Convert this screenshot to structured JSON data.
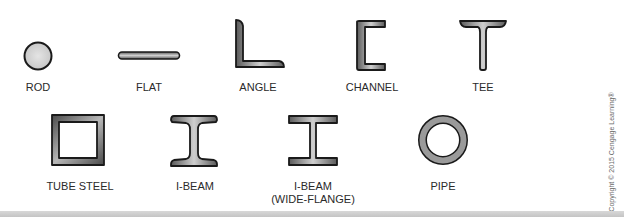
{
  "diagram": {
    "shapes": [
      {
        "id": "rod",
        "label": "ROD"
      },
      {
        "id": "flat",
        "label": "FLAT"
      },
      {
        "id": "angle",
        "label": "ANGLE"
      },
      {
        "id": "channel",
        "label": "CHANNEL"
      },
      {
        "id": "tee",
        "label": "TEE"
      },
      {
        "id": "tube-steel",
        "label": "TUBE STEEL"
      },
      {
        "id": "i-beam",
        "label": "I-BEAM"
      },
      {
        "id": "i-beam-wide-flange",
        "label_line1": "I-BEAM",
        "label_line2": "(WIDE-FLANGE)"
      },
      {
        "id": "pipe",
        "label": "PIPE"
      }
    ],
    "copyright": "Copyright © 2015 Cengage Learning®"
  },
  "colors": {
    "outline": "#1a1a1a",
    "fill_light": "#d9d9d9",
    "fill_dark": "#6e6e6e",
    "label": "#2a2a2a",
    "bottom_bar": "#c8c8c8"
  }
}
